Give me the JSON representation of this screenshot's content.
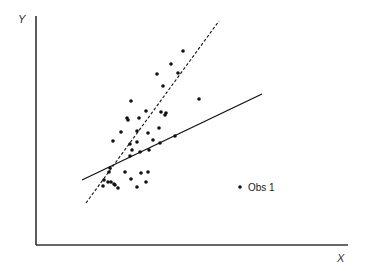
{
  "chart_data": {
    "type": "scatter",
    "title": "",
    "xlabel": "X",
    "ylabel": "Y",
    "grid": false,
    "legend_position": "inside-lower-right",
    "legend": [
      {
        "label": "Obs 1",
        "marker": "dot"
      }
    ],
    "colors": {
      "points": "#111111",
      "lines": "#111111",
      "axes": "#333333"
    },
    "pixel_frame": {
      "x0": 36,
      "y0": 245,
      "x1": 348,
      "y1": 16
    },
    "points_px": [
      [
        183,
        51
      ],
      [
        171,
        64
      ],
      [
        178,
        73
      ],
      [
        199,
        99
      ],
      [
        163,
        86
      ],
      [
        157,
        74
      ],
      [
        146,
        111
      ],
      [
        166,
        113
      ],
      [
        131,
        101
      ],
      [
        127,
        118
      ],
      [
        128,
        120
      ],
      [
        139,
        118
      ],
      [
        148,
        133
      ],
      [
        165,
        115
      ],
      [
        161,
        112
      ],
      [
        121,
        132
      ],
      [
        137,
        131
      ],
      [
        159,
        128
      ],
      [
        175,
        136
      ],
      [
        113,
        141
      ],
      [
        130,
        144
      ],
      [
        137,
        142
      ],
      [
        153,
        140
      ],
      [
        160,
        143
      ],
      [
        149,
        150
      ],
      [
        132,
        150
      ],
      [
        140,
        152
      ],
      [
        130,
        156
      ],
      [
        125,
        172
      ],
      [
        110,
        168
      ],
      [
        109,
        172
      ],
      [
        141,
        173
      ],
      [
        148,
        172
      ],
      [
        104,
        180
      ],
      [
        108,
        182
      ],
      [
        114,
        184
      ],
      [
        111,
        182
      ],
      [
        131,
        179
      ],
      [
        146,
        182
      ],
      [
        137,
        187
      ],
      [
        115,
        185
      ],
      [
        118,
        188
      ],
      [
        103,
        186
      ]
    ],
    "lines": [
      {
        "name": "regression-solid",
        "style": "solid",
        "from_px": [
          82,
          180
        ],
        "to_px": [
          262,
          94
        ]
      },
      {
        "name": "regression-dashed",
        "style": "dashed",
        "from_px": [
          86,
          203
        ],
        "to_px": [
          219,
          21
        ]
      }
    ],
    "legend_marker_px": [
      240,
      187
    ]
  }
}
